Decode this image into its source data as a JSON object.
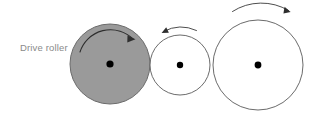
{
  "diagram": {
    "background_color": "#ffffff",
    "label": {
      "text": "Drive roller",
      "color": "#8a8a8a",
      "x": 20,
      "y": 51
    },
    "stroke_color": "#555555",
    "arrow_color": "#333333",
    "center_dot_color": "#000000",
    "rollers": [
      {
        "name": "drive-roller",
        "label": "Drive roller",
        "cx": 110,
        "cy": 64,
        "r": 40,
        "fill": "#9a9a9a",
        "stroke": "#6b6b6b",
        "rotation": "clockwise",
        "arrow_placement": "inside"
      },
      {
        "name": "driven-roller-small",
        "label": "",
        "cx": 180,
        "cy": 65,
        "r": 30,
        "fill": "#ffffff",
        "stroke": "#5a5a5a",
        "rotation": "counterclockwise",
        "arrow_placement": "outside-top"
      },
      {
        "name": "driven-roller-large",
        "label": "",
        "cx": 258,
        "cy": 65,
        "r": 45,
        "fill": "#ffffff",
        "stroke": "#5a5a5a",
        "rotation": "clockwise",
        "arrow_placement": "outside-top"
      }
    ]
  }
}
